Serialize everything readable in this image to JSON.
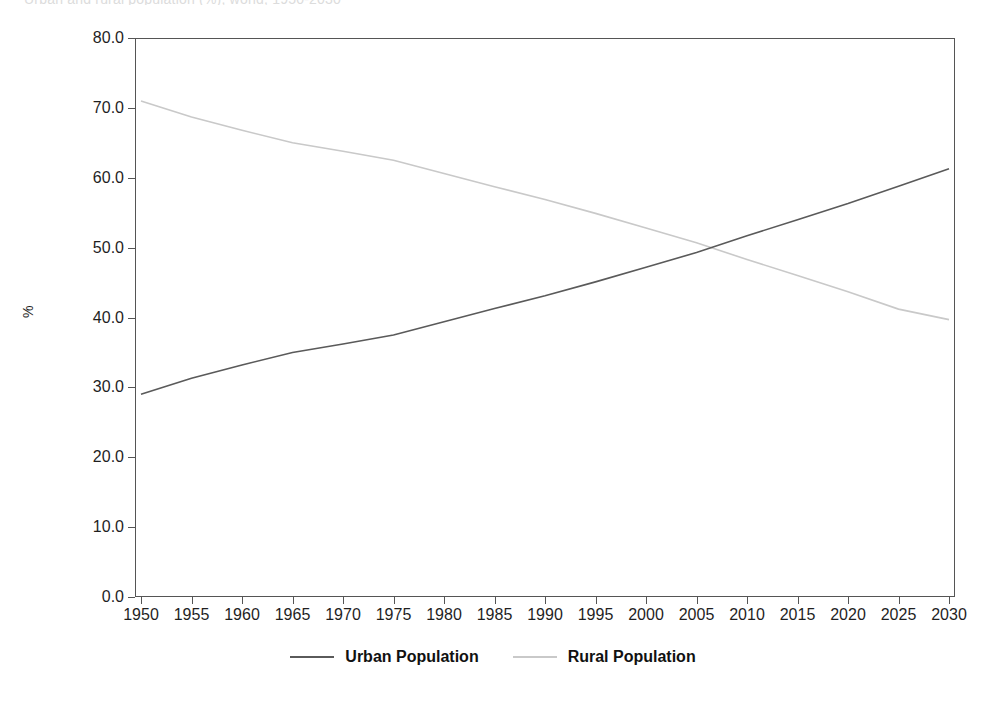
{
  "figure": {
    "cut_off_title": "Urban and rural population (%), world, 1950-2030",
    "background_color": "#ffffff",
    "frame_color": "#555555"
  },
  "axes": {
    "y_axis_title": "%",
    "y_ticks": [
      "0.0",
      "10.0",
      "20.0",
      "30.0",
      "40.0",
      "50.0",
      "60.0",
      "70.0",
      "80.0"
    ],
    "x_ticks": [
      "1950",
      "1955",
      "1960",
      "1965",
      "1970",
      "1975",
      "1980",
      "1985",
      "1990",
      "1995",
      "2000",
      "2005",
      "2010",
      "2015",
      "2020",
      "2025",
      "2030"
    ]
  },
  "legend": {
    "position": "bottom-center",
    "entries": [
      {
        "label": "Urban Population",
        "color": "#5a5a5a"
      },
      {
        "label": "Rural Population",
        "color": "#c9c9c9"
      }
    ]
  },
  "chart_data": {
    "type": "line",
    "title": "Urban and rural population (%), world, 1950-2030",
    "xlabel": "",
    "ylabel": "%",
    "xlim": [
      1950,
      2030
    ],
    "ylim": [
      0.0,
      80.0
    ],
    "ytick_step": 10.0,
    "xtick_step": 5,
    "grid": false,
    "x": [
      1950,
      1955,
      1960,
      1965,
      1970,
      1975,
      1980,
      1985,
      1990,
      1995,
      2000,
      2005,
      2010,
      2015,
      2020,
      2025,
      2030
    ],
    "series": [
      {
        "name": "Urban Population",
        "color": "#5a5a5a",
        "values": [
          29.0,
          31.3,
          33.2,
          35.0,
          36.2,
          37.5,
          39.4,
          41.3,
          43.1,
          45.1,
          47.2,
          49.3,
          51.7,
          54.0,
          56.3,
          58.8,
          61.3
        ]
      },
      {
        "name": "Rural Population",
        "color": "#c9c9c9",
        "values": [
          71.0,
          68.7,
          66.8,
          65.0,
          63.8,
          62.5,
          60.6,
          58.7,
          56.9,
          54.9,
          52.8,
          50.7,
          48.3,
          46.0,
          43.7,
          41.2,
          39.7
        ]
      }
    ],
    "crossover": {
      "year": 2007,
      "value": 50.3
    }
  }
}
